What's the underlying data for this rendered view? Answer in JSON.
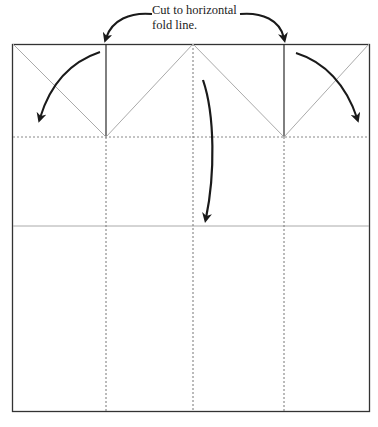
{
  "diagram": {
    "caption_line1": "Cut to horizontal",
    "caption_line2": "fold line.",
    "colors": {
      "outline": "#333333",
      "cut_line": "#2a2a2a",
      "fold_line": "#888888",
      "diagonal": "#aaaaaa",
      "arrow": "#1a1a1a"
    },
    "elements": {
      "square": "paper-square",
      "cut_lines": 2,
      "vertical_fold_lines": 3,
      "horizontal_fold_lines": 2,
      "arrows": 3
    }
  }
}
